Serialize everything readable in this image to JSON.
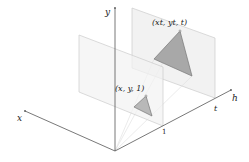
{
  "diagram": {
    "axes": {
      "x_label": "x",
      "y_label": "y",
      "h_label": "h"
    },
    "ticks": {
      "one_label": "1",
      "t_label": "t"
    },
    "points": {
      "near_label": "(x, y, 1)",
      "far_label": "(xt, yt, t)"
    },
    "colors": {
      "axis": "#555555",
      "plane_fill": "#eeeeee",
      "plane_stroke": "#cccccc",
      "triangle_fill": "#a8a8a8",
      "triangle_stroke": "#777777",
      "ray": "#dddddd"
    }
  }
}
